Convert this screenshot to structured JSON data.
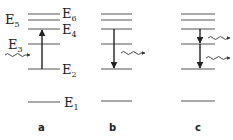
{
  "diagram": {
    "type": "energy-level-diagram",
    "panels": [
      {
        "id": "a",
        "label": "a",
        "transition": "absorption E2 to E4",
        "photons_in": 1,
        "photons_out": 0
      },
      {
        "id": "b",
        "label": "b",
        "transition": "emission E4 to E2",
        "photons_in": 0,
        "photons_out": 1
      },
      {
        "id": "c",
        "label": "c",
        "transition": "cascade emission E4 to E3 to E2",
        "photons_in": 0,
        "photons_out": 2
      }
    ],
    "levels": [
      {
        "name": "E1",
        "base": "E",
        "sub": "1",
        "y": 102
      },
      {
        "name": "E2",
        "base": "E",
        "sub": "2",
        "y": 69
      },
      {
        "name": "E3",
        "base": "E",
        "sub": "3",
        "y": 44
      },
      {
        "name": "E4",
        "base": "E",
        "sub": "4",
        "y": 29
      },
      {
        "name": "E5",
        "base": "E",
        "sub": "5",
        "y": 20
      },
      {
        "name": "E6",
        "base": "E",
        "sub": "6",
        "y": 14
      }
    ],
    "labels": {
      "e1": "E",
      "e1_sub": "1",
      "e2": "E",
      "e2_sub": "2",
      "e3": "E",
      "e3_sub": "3",
      "e4": "E",
      "e4_sub": "4",
      "e5": "E",
      "e5_sub": "5",
      "e6": "E",
      "e6_sub": "6",
      "panel_a": "a",
      "panel_b": "b",
      "panel_c": "c"
    }
  }
}
